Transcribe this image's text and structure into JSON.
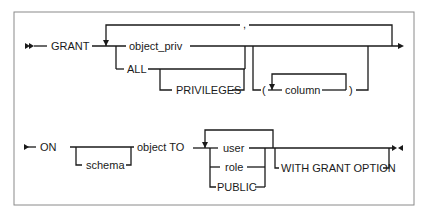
{
  "diagram": {
    "type": "railroad-syntax-diagram",
    "statement": "GRANT",
    "row1": {
      "keyword": "GRANT",
      "choices": [
        "object_priv",
        "ALL"
      ],
      "optional_after_all": "PRIVILEGES",
      "repeat_separator": ",",
      "column_group": {
        "open_paren": "(",
        "item": "column",
        "close_paren": ")"
      }
    },
    "row2": {
      "keyword": "ON",
      "optional_prefix": "schema",
      "object_to": "object TO",
      "grantees": [
        "user",
        "role",
        "PUBLIC"
      ],
      "optional_suffix": "WITH GRANT OPTION"
    }
  }
}
